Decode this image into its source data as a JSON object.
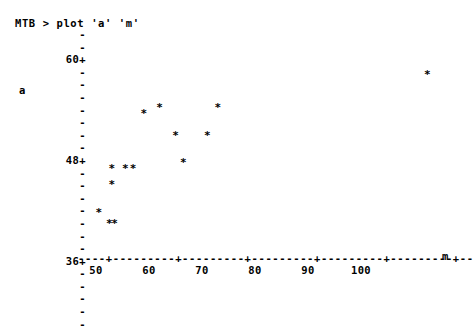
{
  "window": {
    "title": "Minitab session plot output",
    "background_color": "#ffffff",
    "text_color": "#000000"
  },
  "session": {
    "prompt_line": "MTB > plot 'a' 'm'"
  },
  "chart_data": {
    "type": "scatter",
    "title": "",
    "subtitle": "",
    "xlabel": "m",
    "ylabel": "a",
    "xlim": [
      46,
      103
    ],
    "ylim": [
      27,
      64.5
    ],
    "grid": false,
    "legend": null,
    "marker": "*",
    "x_tick_labels": [
      "50",
      "60",
      "70",
      "80",
      "90",
      "100"
    ],
    "x_tick_values": [
      50,
      60,
      70,
      80,
      90,
      100
    ],
    "y_tick_labels": [
      "60+",
      "48+",
      "36+"
    ],
    "y_tick_values": [
      60,
      48,
      36
    ],
    "y_minor_tick_values": [
      63,
      61.5,
      58.5,
      57,
      55.5,
      54,
      52.5,
      51,
      49.5,
      46.5,
      45,
      43.5,
      42,
      40.5,
      39,
      37.5,
      34.5,
      33,
      31.5,
      30,
      28.5
    ],
    "axis_rule": "----+---------+---------+---------+---------+---------+--",
    "x": [
      50.5,
      52.5,
      53.0,
      53.0,
      53.5,
      55.5,
      57.0,
      59.0,
      62.0,
      65.0,
      66.5,
      71.0,
      73.0,
      112.5
    ],
    "y": [
      33.0,
      31.0,
      41.0,
      38.0,
      31.0,
      41.0,
      41.0,
      51.0,
      52.0,
      47.0,
      42.0,
      47.0,
      52.0,
      58.0
    ],
    "points": [
      {
        "x": 50.5,
        "y": 33.0
      },
      {
        "x": 52.5,
        "y": 31.0
      },
      {
        "x": 53.0,
        "y": 41.0
      },
      {
        "x": 53.0,
        "y": 38.0
      },
      {
        "x": 53.5,
        "y": 31.0
      },
      {
        "x": 55.5,
        "y": 41.0
      },
      {
        "x": 57.0,
        "y": 41.0
      },
      {
        "x": 59.0,
        "y": 51.0
      },
      {
        "x": 62.0,
        "y": 52.0
      },
      {
        "x": 65.0,
        "y": 47.0
      },
      {
        "x": 66.5,
        "y": 42.0
      },
      {
        "x": 71.0,
        "y": 47.0
      },
      {
        "x": 73.0,
        "y": 52.0
      },
      {
        "x": 112.5,
        "y": 58.0
      }
    ]
  }
}
